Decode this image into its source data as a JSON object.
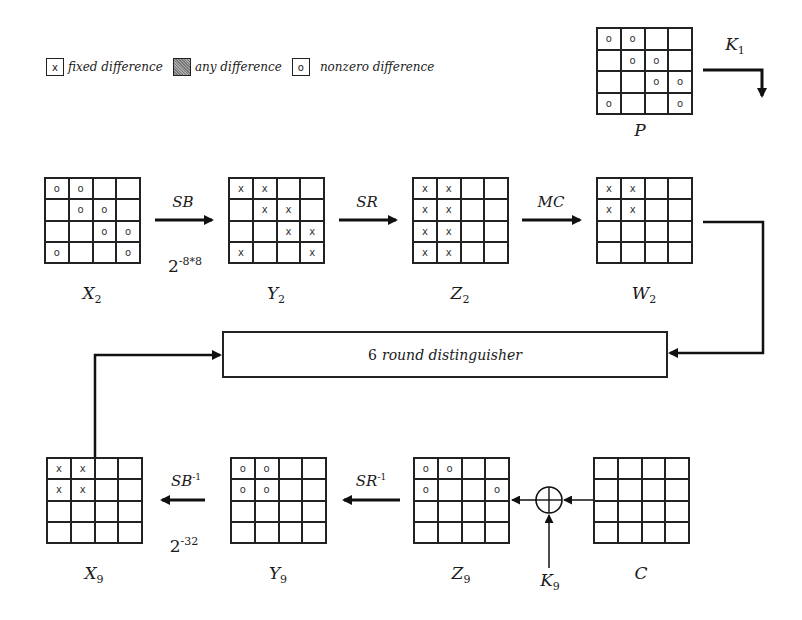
{
  "legend": {
    "items": [
      {
        "symbol": "x",
        "label": "fixed difference",
        "style": "plain"
      },
      {
        "symbol": "",
        "label": "any difference",
        "style": "shaded"
      },
      {
        "symbol": "o",
        "label": "nonzero difference",
        "style": "plain"
      }
    ]
  },
  "states": {
    "P": {
      "name": "P",
      "sub": "",
      "cells": [
        [
          "o",
          "o",
          "",
          ""
        ],
        [
          "",
          "o",
          "o",
          ""
        ],
        [
          "",
          "",
          "o",
          "o"
        ],
        [
          "o",
          "",
          "",
          "o"
        ]
      ]
    },
    "X2": {
      "name": "X",
      "sub": "2",
      "cells": [
        [
          "o",
          "o",
          "",
          ""
        ],
        [
          "",
          "o",
          "o",
          ""
        ],
        [
          "",
          "",
          "o",
          "o"
        ],
        [
          "o",
          "",
          "",
          "o"
        ]
      ]
    },
    "Y2": {
      "name": "Y",
      "sub": "2",
      "cells": [
        [
          "x",
          "x",
          "",
          ""
        ],
        [
          "",
          "x",
          "x",
          ""
        ],
        [
          "",
          "",
          "x",
          "x"
        ],
        [
          "x",
          "",
          "",
          "x"
        ]
      ]
    },
    "Z2": {
      "name": "Z",
      "sub": "2",
      "cells": [
        [
          "x",
          "x",
          "",
          ""
        ],
        [
          "x",
          "x",
          "",
          ""
        ],
        [
          "x",
          "x",
          "",
          ""
        ],
        [
          "x",
          "x",
          "",
          ""
        ]
      ]
    },
    "W2": {
      "name": "W",
      "sub": "2",
      "cells": [
        [
          "x",
          "x",
          "",
          ""
        ],
        [
          "x",
          "x",
          "",
          ""
        ],
        [
          "",
          "",
          "",
          ""
        ],
        [
          "",
          "",
          "",
          ""
        ]
      ]
    },
    "X9": {
      "name": "X",
      "sub": "9",
      "cells": [
        [
          "x",
          "x",
          "",
          ""
        ],
        [
          "x",
          "x",
          "",
          ""
        ],
        [
          "",
          "",
          "",
          ""
        ],
        [
          "",
          "",
          "",
          ""
        ]
      ]
    },
    "Y9": {
      "name": "Y",
      "sub": "9",
      "cells": [
        [
          "o",
          "o",
          "",
          ""
        ],
        [
          "o",
          "o",
          "",
          ""
        ],
        [
          "",
          "",
          "",
          ""
        ],
        [
          "",
          "",
          "",
          ""
        ]
      ]
    },
    "Z9": {
      "name": "Z",
      "sub": "9",
      "cells": [
        [
          "o",
          "o",
          "",
          ""
        ],
        [
          "o",
          "",
          "",
          "o"
        ],
        [
          "",
          "",
          "",
          ""
        ],
        [
          "",
          "",
          "",
          ""
        ]
      ]
    },
    "C": {
      "name": "C",
      "sub": "",
      "cells": [
        [
          "",
          "",
          "",
          ""
        ],
        [
          "",
          "",
          "",
          ""
        ],
        [
          "",
          "",
          "",
          ""
        ],
        [
          "",
          "",
          "",
          ""
        ]
      ]
    }
  },
  "operations": {
    "sb": {
      "base": "SB",
      "sup": ""
    },
    "sr": {
      "base": "SR",
      "sup": ""
    },
    "mc": {
      "base": "MC",
      "sup": ""
    },
    "sb_inv": {
      "base": "SB",
      "sup": "-1"
    },
    "sr_inv": {
      "base": "SR",
      "sup": "-1"
    }
  },
  "probabilities": {
    "sb": {
      "base": "2",
      "exp": "-8*8"
    },
    "sb_inv": {
      "base": "2",
      "exp": "-32"
    }
  },
  "keys": {
    "k1": {
      "name": "K",
      "sub": "1"
    },
    "k9": {
      "name": "K",
      "sub": "9"
    }
  },
  "distinguisher": {
    "count": "6",
    "label": "round distinguisher"
  }
}
